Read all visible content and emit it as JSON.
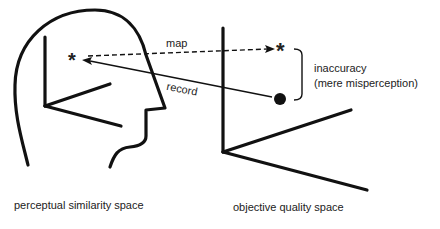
{
  "labels": {
    "map": "map",
    "record": "record",
    "inaccuracy": "inaccuracy",
    "misperception": "(mere misperception)",
    "perceptual_space": "perceptual similarity space",
    "objective_space": "objective quality space"
  },
  "symbols": {
    "perceived_point": "*",
    "mapped_point": "*"
  },
  "colors": {
    "ink": "#111111",
    "background": "#ffffff"
  }
}
